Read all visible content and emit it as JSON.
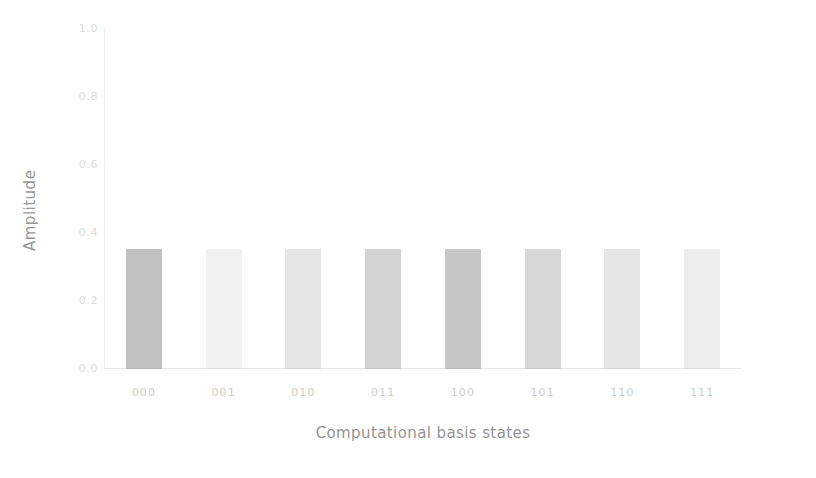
{
  "chart_data": {
    "type": "bar",
    "title": "",
    "subtitle": "",
    "xlabel": "Computational basis states",
    "ylabel": "Amplitude",
    "categories": [
      "000",
      "001",
      "010",
      "011",
      "100",
      "101",
      "110",
      "111"
    ],
    "values": [
      0.354,
      0.354,
      0.354,
      0.354,
      0.354,
      0.354,
      0.354,
      0.354
    ],
    "series": [
      {
        "name": "Amplitude",
        "values": [
          0.354,
          0.354,
          0.354,
          0.354,
          0.354,
          0.354,
          0.354,
          0.354
        ]
      }
    ],
    "bar_colors": [
      "#8a8a8a",
      "#d2d2d2",
      "#bcbcbc",
      "#9c9c9c",
      "#8d8d8d",
      "#a3a3a3",
      "#bdbdbd",
      "#c9c9c9"
    ],
    "ylim": [
      0.0,
      1.0
    ],
    "yticks": [
      0.0,
      0.2,
      0.4,
      0.6,
      0.8,
      1.0
    ],
    "ytick_labels": [
      "0.0",
      "0.2",
      "0.4",
      "0.6",
      "0.8",
      "1.0"
    ],
    "xtick_labels": [
      "000",
      "001",
      "010",
      "011",
      "100",
      "101",
      "110",
      "111"
    ],
    "grid": false,
    "legend": null,
    "legend_position": "none",
    "annotations": []
  },
  "axes": {
    "y_title": "Amplitude",
    "x_title": "Computational basis states",
    "y_tick_labels": [
      "1.0",
      "0.8",
      "0.6",
      "0.4",
      "0.2",
      "0.0"
    ],
    "y_tick_values": [
      1.0,
      0.8,
      0.6,
      0.4,
      0.2,
      0.0
    ]
  },
  "style": {
    "background": "#ffffff",
    "axis_color": "#c9c9c9",
    "tick_label_color": "#9a9a9a",
    "axis_title_color": "#6e6e6e"
  }
}
